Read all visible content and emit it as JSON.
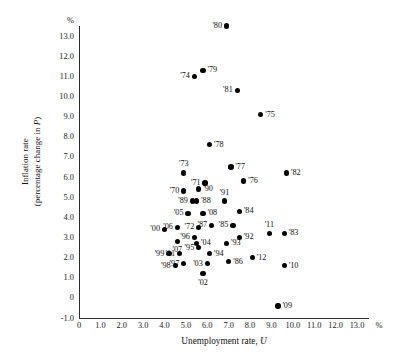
{
  "chart_data": {
    "type": "scatter",
    "title": "",
    "xlabel": "Unemployment rate, U",
    "ylabel": "Inflation rate (percentage change in P)",
    "x_unit": "%",
    "y_unit": "%",
    "xlim": [
      0,
      13.5
    ],
    "ylim": [
      -1.0,
      13.5
    ],
    "xticks": [
      "0",
      "1.0",
      "2.0",
      "3.0",
      "4.0",
      "5.0",
      "6.0",
      "7.0",
      "8.0",
      "9.0",
      "10.0",
      "11.0",
      "12.0",
      "13.0"
    ],
    "xtickvals": [
      0,
      1,
      2,
      3,
      4,
      5,
      6,
      7,
      8,
      9,
      10,
      11,
      12,
      13
    ],
    "yticks": [
      "13.0",
      "12.0",
      "11.0",
      "10.0",
      "9.0",
      "8.0",
      "7.0",
      "6.0",
      "5.0",
      "4.0",
      "3.0",
      "2.0",
      "1.0",
      "0",
      "-1.0"
    ],
    "ytickvals": [
      13,
      12,
      11,
      10,
      9,
      8,
      7,
      6,
      5,
      4,
      3,
      2,
      1,
      0,
      -1
    ],
    "grid": false,
    "legend": false,
    "points": [
      {
        "label": "'80",
        "x": 6.9,
        "y": 13.5,
        "lp": "l"
      },
      {
        "label": "'79",
        "x": 5.8,
        "y": 11.3,
        "lp": "r"
      },
      {
        "label": "'74",
        "x": 5.4,
        "y": 11.0,
        "lp": "l"
      },
      {
        "label": "'81",
        "x": 7.4,
        "y": 10.3,
        "lp": "l"
      },
      {
        "label": "'75",
        "x": 8.5,
        "y": 9.1,
        "lp": "r"
      },
      {
        "label": "'78",
        "x": 6.1,
        "y": 7.6,
        "lp": "r"
      },
      {
        "label": "'73",
        "x": 4.9,
        "y": 6.2,
        "lp": "t"
      },
      {
        "label": "'77",
        "x": 7.1,
        "y": 6.5,
        "lp": "r"
      },
      {
        "label": "'82",
        "x": 9.7,
        "y": 6.2,
        "lp": "r"
      },
      {
        "label": "'71",
        "x": 5.9,
        "y": 5.7,
        "lp": "l"
      },
      {
        "label": "'76",
        "x": 7.7,
        "y": 5.8,
        "lp": "r"
      },
      {
        "label": "'70",
        "x": 4.9,
        "y": 5.3,
        "lp": "l"
      },
      {
        "label": "'90",
        "x": 5.6,
        "y": 5.4,
        "lp": "r"
      },
      {
        "label": "'89",
        "x": 5.3,
        "y": 4.8,
        "lp": "l"
      },
      {
        "label": "'88",
        "x": 5.5,
        "y": 4.8,
        "lp": "r"
      },
      {
        "label": "'91",
        "x": 6.8,
        "y": 4.8,
        "lp": "t"
      },
      {
        "label": "'05",
        "x": 5.1,
        "y": 4.2,
        "lp": "l"
      },
      {
        "label": "'08",
        "x": 5.8,
        "y": 4.2,
        "lp": "r"
      },
      {
        "label": "'84",
        "x": 7.5,
        "y": 4.3,
        "lp": "r"
      },
      {
        "label": "'00",
        "x": 4.0,
        "y": 3.4,
        "lp": "l"
      },
      {
        "label": "'06",
        "x": 4.6,
        "y": 3.5,
        "lp": "l"
      },
      {
        "label": "'72",
        "x": 5.6,
        "y": 3.5,
        "lp": "l"
      },
      {
        "label": "'87",
        "x": 6.2,
        "y": 3.6,
        "lp": "l"
      },
      {
        "label": "'85",
        "x": 7.2,
        "y": 3.6,
        "lp": "l"
      },
      {
        "label": "'11",
        "x": 8.9,
        "y": 3.2,
        "lp": "t"
      },
      {
        "label": "'83",
        "x": 9.6,
        "y": 3.2,
        "lp": "r"
      },
      {
        "label": "'96",
        "x": 5.4,
        "y": 3.0,
        "lp": "l"
      },
      {
        "label": "'07",
        "x": 4.6,
        "y": 2.8,
        "lp": "b"
      },
      {
        "label": "'04",
        "x": 5.5,
        "y": 2.7,
        "lp": "r"
      },
      {
        "label": "'92",
        "x": 7.5,
        "y": 3.0,
        "lp": "r"
      },
      {
        "label": "'99",
        "x": 4.2,
        "y": 2.2,
        "lp": "l"
      },
      {
        "label": "'01",
        "x": 4.7,
        "y": 2.2,
        "lp": "l"
      },
      {
        "label": "'95",
        "x": 5.6,
        "y": 2.5,
        "lp": "l"
      },
      {
        "label": "'94",
        "x": 6.1,
        "y": 2.2,
        "lp": "r"
      },
      {
        "label": "'93",
        "x": 6.9,
        "y": 2.7,
        "lp": "r"
      },
      {
        "label": "'98",
        "x": 4.5,
        "y": 1.6,
        "lp": "l"
      },
      {
        "label": "'97",
        "x": 4.9,
        "y": 1.7,
        "lp": "l"
      },
      {
        "label": "'03",
        "x": 6.0,
        "y": 1.7,
        "lp": "l"
      },
      {
        "label": "'86",
        "x": 7.0,
        "y": 1.8,
        "lp": "r"
      },
      {
        "label": "'12",
        "x": 8.1,
        "y": 2.0,
        "lp": "r"
      },
      {
        "label": "'02",
        "x": 5.8,
        "y": 1.2,
        "lp": "b"
      },
      {
        "label": "'10",
        "x": 9.6,
        "y": 1.6,
        "lp": "r"
      },
      {
        "label": "'09",
        "x": 9.3,
        "y": -0.4,
        "lp": "r"
      }
    ]
  }
}
